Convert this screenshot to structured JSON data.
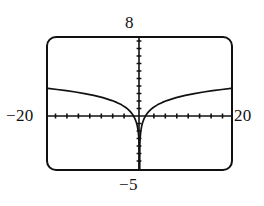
{
  "figure": {
    "name": "graphing-calculator-screen"
  },
  "labels": {
    "ymax": "8",
    "ymin": "−5",
    "xmin": "−20",
    "xmax": "20"
  },
  "colors": {
    "ink": "#111111",
    "screen_bg": "#ffffff",
    "frame": "#111111"
  },
  "chart_data": {
    "type": "line",
    "title": "",
    "xlabel": "",
    "ylabel": "",
    "xlim": [
      -20,
      20
    ],
    "ylim": [
      -5,
      8
    ],
    "grid": false,
    "legend": null,
    "axis_labels": {
      "left": "−20",
      "right": "20",
      "top": "8",
      "bottom": "−5"
    },
    "xtick_spacing": 2.5,
    "ytick_spacing": 0.5,
    "xticks": [
      -20,
      -17.5,
      -15,
      -12.5,
      -10,
      -7.5,
      -5,
      -2.5,
      0,
      2.5,
      5,
      7.5,
      10,
      12.5,
      15,
      17.5,
      20
    ],
    "yticks": [
      -5,
      -4.5,
      -4,
      -3.5,
      -3,
      -2.5,
      -2,
      -1.5,
      -1,
      -0.5,
      0,
      0.5,
      1,
      1.5,
      2,
      2.5,
      3,
      3.5,
      4,
      4.5,
      5,
      5.5,
      6,
      6.5,
      7,
      7.5,
      8
    ],
    "function": "y = ln|x|",
    "series": [
      {
        "name": "y = ln|x|",
        "x": [
          -20,
          -18,
          -16,
          -14,
          -12,
          -10,
          -8,
          -6,
          -5,
          -4,
          -3,
          -2.5,
          -2,
          -1.5,
          -1,
          -0.7,
          -0.5,
          -0.3,
          -0.2,
          -0.1,
          -0.05,
          -0.02,
          -0.01,
          -0.005,
          0.005,
          0.01,
          0.02,
          0.05,
          0.1,
          0.2,
          0.3,
          0.5,
          0.7,
          1,
          1.5,
          2,
          2.5,
          3,
          4,
          5,
          6,
          8,
          10,
          12,
          14,
          16,
          18,
          20
        ],
        "y": [
          3.0,
          2.89,
          2.77,
          2.64,
          2.48,
          2.3,
          2.08,
          1.79,
          1.61,
          1.39,
          1.1,
          0.92,
          0.69,
          0.41,
          0.0,
          -0.36,
          -0.69,
          -1.2,
          -1.61,
          -2.3,
          -3.0,
          -3.91,
          -4.61,
          -5.3,
          -5.3,
          -4.61,
          -3.91,
          -3.0,
          -2.3,
          -1.61,
          -1.2,
          -0.69,
          -0.36,
          0.0,
          0.41,
          0.69,
          0.92,
          1.1,
          1.39,
          1.61,
          1.79,
          2.08,
          2.3,
          2.48,
          2.64,
          2.77,
          2.89,
          3.0
        ]
      }
    ]
  }
}
